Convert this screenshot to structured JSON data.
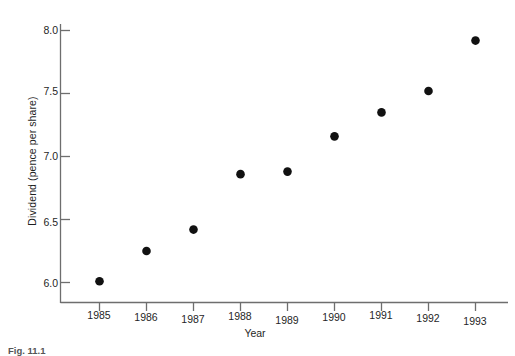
{
  "chart_data": {
    "type": "scatter",
    "title": "",
    "xlabel": "Year",
    "ylabel": "Dividend (pence per share)",
    "categories": [
      "1985",
      "1986",
      "1987",
      "1988",
      "1989",
      "1990",
      "1991",
      "1992",
      "1993"
    ],
    "x": [
      1985,
      1986,
      1987,
      1988,
      1989,
      1990,
      1991,
      1992,
      1993
    ],
    "values": [
      6.01,
      6.25,
      6.42,
      6.86,
      6.88,
      7.16,
      7.35,
      7.52,
      7.92
    ],
    "series": [
      {
        "name": "Dividend",
        "values": [
          6.01,
          6.25,
          6.42,
          6.86,
          6.88,
          7.16,
          7.35,
          7.52,
          7.92
        ]
      }
    ],
    "ylim": [
      5.84,
      8.0
    ],
    "xlim": [
      1984.5,
      1993.6
    ],
    "yticks": [
      6.0,
      6.5,
      7.0,
      7.5,
      8.0
    ],
    "ytick_labels": [
      "6.0",
      "6.5",
      "7.0",
      "7.5",
      "8.0"
    ],
    "xticks": [
      1985,
      1986,
      1987,
      1988,
      1989,
      1990,
      1991,
      1992,
      1993
    ],
    "xtick_labels": [
      "1985",
      "1986",
      "1987",
      "1988",
      "1989",
      "1990",
      "1991",
      "1992",
      "1993"
    ],
    "grid": false,
    "legend": false,
    "legend_position": "none",
    "marker": "filled-circle",
    "marker_color": "#111111",
    "axis_color": "#6a6a6a",
    "background_color": "#ffffff"
  },
  "figure": {
    "caption": "Fig. 11.1"
  }
}
